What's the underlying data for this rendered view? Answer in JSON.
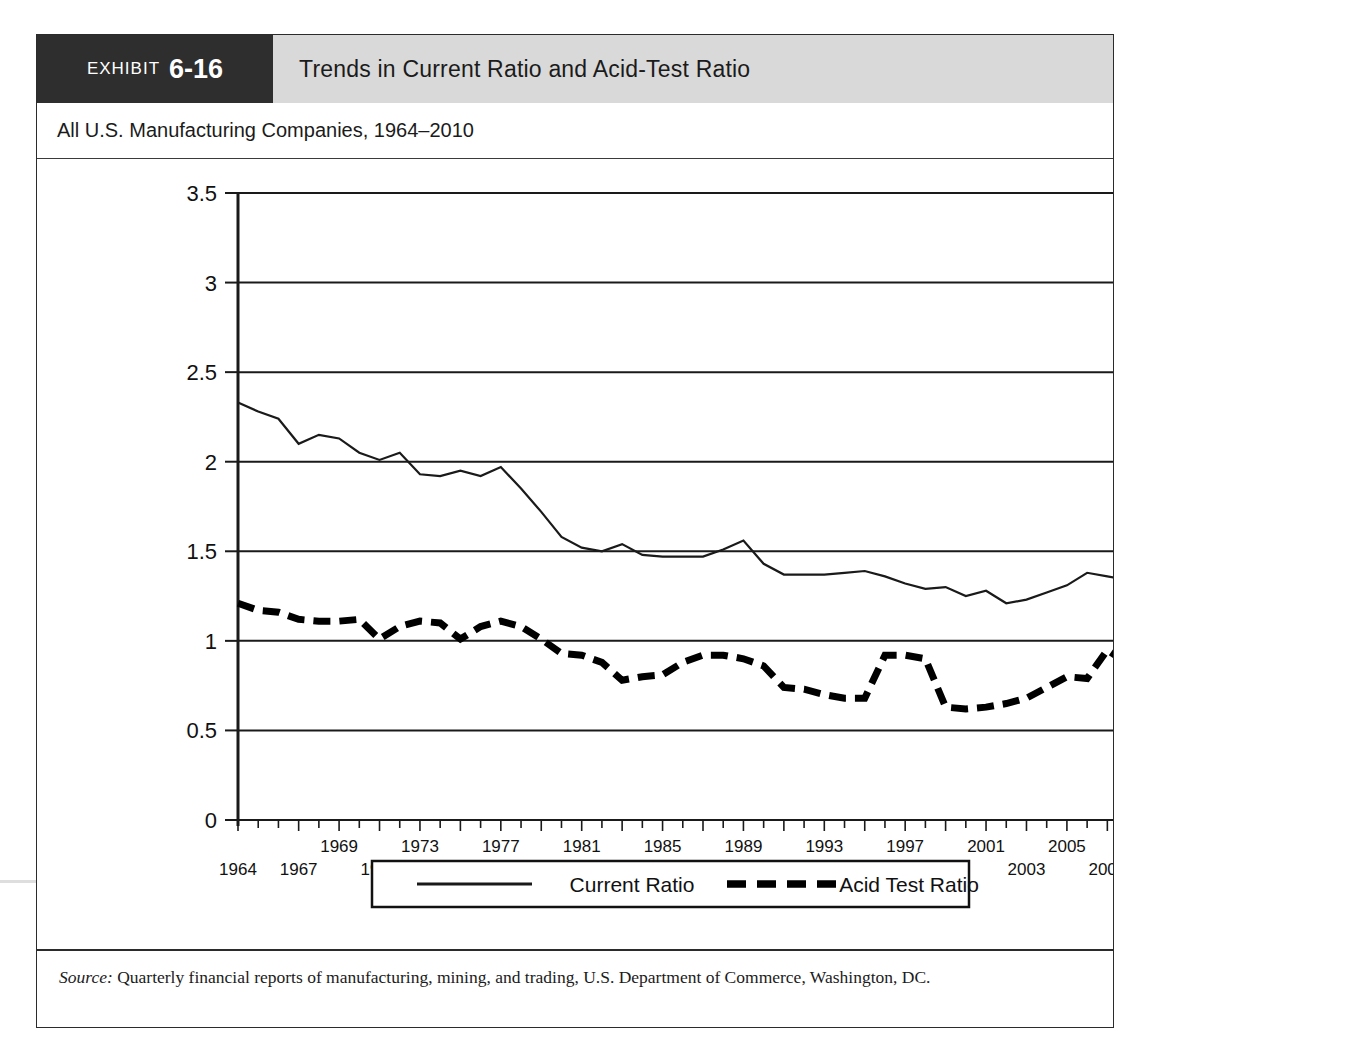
{
  "exhibit": {
    "label": "EXHIBIT",
    "number": "6-16",
    "title": "Trends in Current Ratio and Acid-Test Ratio",
    "subtitle": "All U.S. Manufacturing Companies, 1964–2010",
    "source_label": "Source:",
    "source_text": " Quarterly financial reports of manufacturing, mining, and trading, U.S. Department of Commerce, Washington, DC."
  },
  "colors": {
    "tag_background": "#2e2e2e",
    "header_background": "#d9d9d9",
    "frame_border": "#2b2b2b",
    "line_current": "#1a1a1a",
    "line_acid": "#000000",
    "grid": "#1a1a1a"
  },
  "chart_data": {
    "type": "line",
    "title": "Trends in Current Ratio and Acid-Test Ratio",
    "subtitle": "All U.S. Manufacturing Companies, 1964–2010",
    "xlabel": "",
    "ylabel": "",
    "xlim": [
      1964,
      2010
    ],
    "ylim": [
      0,
      3.5
    ],
    "ytick_labels": [
      "0",
      "0.5",
      "1",
      "1.5",
      "2",
      "2.5",
      "3",
      "3.5"
    ],
    "yticks": [
      0,
      0.5,
      1,
      1.5,
      2,
      2.5,
      3,
      3.5
    ],
    "grid": true,
    "grid_axis": "y",
    "legend_position": "bottom",
    "x": [
      1964,
      1965,
      1966,
      1967,
      1968,
      1969,
      1970,
      1971,
      1972,
      1973,
      1974,
      1975,
      1976,
      1977,
      1978,
      1979,
      1980,
      1981,
      1982,
      1983,
      1984,
      1985,
      1986,
      1987,
      1988,
      1989,
      1990,
      1991,
      1992,
      1993,
      1994,
      1995,
      1996,
      1997,
      1998,
      1999,
      2000,
      2001,
      2002,
      2003,
      2004,
      2005,
      2006,
      2007,
      2008,
      2009,
      2010
    ],
    "xtick_labels_upper": [
      "1969",
      "1973",
      "1977",
      "1981",
      "1985",
      "1989",
      "1993",
      "1997",
      "2001",
      "2005",
      "2009"
    ],
    "xtick_labels_lower": [
      "1964",
      "1967",
      "1971",
      "1975",
      "1979",
      "1983",
      "1987",
      "1991",
      "1995",
      "1999",
      "2003",
      "2007",
      "2010"
    ],
    "xtick_labels_all": [
      "1964",
      "1967",
      "1969",
      "1971",
      "1973",
      "1975",
      "1977",
      "1979",
      "1981",
      "1983",
      "1985",
      "1987",
      "1989",
      "1991",
      "1993",
      "1995",
      "1997",
      "1999",
      "2001",
      "2003",
      "2005",
      "2007",
      "2009",
      "2010"
    ],
    "series": [
      {
        "name": "Current Ratio",
        "style": "solid",
        "values": [
          2.33,
          2.28,
          2.24,
          2.1,
          2.15,
          2.13,
          2.05,
          2.01,
          2.05,
          1.93,
          1.92,
          1.95,
          1.92,
          1.97,
          1.85,
          1.72,
          1.58,
          1.52,
          1.5,
          1.54,
          1.48,
          1.47,
          1.47,
          1.47,
          1.51,
          1.56,
          1.43,
          1.37,
          1.37,
          1.37,
          1.38,
          1.39,
          1.36,
          1.32,
          1.29,
          1.3,
          1.25,
          1.28,
          1.21,
          1.23,
          1.27,
          1.31,
          1.38,
          1.36,
          1.34,
          1.4,
          1.43
        ]
      },
      {
        "name": "Acid Test Ratio",
        "style": "dashed",
        "values": [
          1.21,
          1.17,
          1.16,
          1.12,
          1.11,
          1.11,
          1.12,
          1.01,
          1.08,
          1.11,
          1.1,
          1.01,
          1.08,
          1.11,
          1.08,
          1.01,
          0.93,
          0.92,
          0.88,
          0.78,
          0.8,
          0.81,
          0.88,
          0.92,
          0.92,
          0.9,
          0.86,
          0.74,
          0.73,
          0.7,
          0.68,
          0.68,
          0.92,
          0.92,
          0.9,
          0.63,
          0.62,
          0.63,
          0.65,
          0.68,
          0.74,
          0.8,
          0.79,
          0.95,
          0.87,
          0.8,
          0.79
        ]
      }
    ],
    "legend": [
      {
        "label": "Current Ratio",
        "style": "solid"
      },
      {
        "label": "Acid Test Ratio",
        "style": "dashed"
      }
    ]
  }
}
